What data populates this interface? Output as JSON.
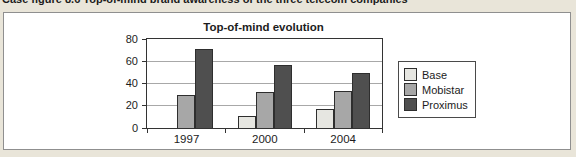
{
  "caption": "Case figure 8.6 Top-of-mind brand awareness of the three telecom companies",
  "chart_data": {
    "type": "bar",
    "title": "Top-of-mind evolution",
    "categories": [
      "1997",
      "2000",
      "2004"
    ],
    "series": [
      {
        "name": "Base",
        "color": "#e6e6e1",
        "values": [
          0,
          11,
          17
        ]
      },
      {
        "name": "Mobistar",
        "color": "#a7a7a7",
        "values": [
          30,
          32,
          33
        ]
      },
      {
        "name": "Proximus",
        "color": "#4f4f4f",
        "values": [
          71,
          57,
          49
        ]
      }
    ],
    "xlabel": "",
    "ylabel": "",
    "ylim": [
      0,
      80
    ],
    "yticks": [
      0,
      20,
      40,
      60,
      80
    ],
    "grid": "horizontal",
    "legend_position": "right"
  },
  "colors": {
    "page_bg": "#e9e5d9",
    "panel_bg": "#ffffff",
    "panel_border": "#8f8f8f",
    "plot_border": "#333333",
    "gridline": "#a8a8a8",
    "bar_border": "#2e2e2e",
    "legend_border": "#4a4a4a",
    "text": "#1c1c1c"
  }
}
